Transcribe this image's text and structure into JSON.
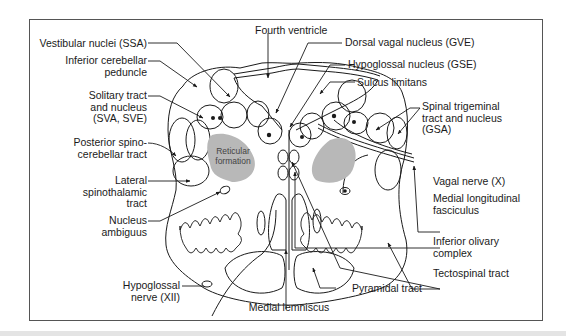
{
  "figure": {
    "colors": {
      "line": "#1a1a1a",
      "reticular_fill": "#b8b8b8",
      "frame": "#555555",
      "background": "#ffffff"
    }
  },
  "labels": {
    "top": {
      "fourth_ventricle": "Fourth ventricle"
    },
    "left": {
      "vestibular_nuclei": "Vestibular nuclei (SSA)",
      "inferior_cerebellar_peduncle": [
        "Inferior cerebellar",
        "peduncle"
      ],
      "solitary_tract": [
        "Solitary tract",
        "and nucleus",
        "(SVA, SVE)"
      ],
      "posterior_spinocerebellar": [
        "Posterior spino-",
        "cerebellar tract"
      ],
      "lateral_spinothalamic": [
        "Lateral",
        "spinothalamic",
        "tract"
      ],
      "nucleus_ambiguus": [
        "Nucleus",
        "ambiguus"
      ],
      "hypoglossal_nerve": [
        "Hypoglossal",
        "nerve (XII)"
      ]
    },
    "right": {
      "dorsal_vagal_nucleus": "Dorsal vagal nucleus (GVE)",
      "hypoglossal_nucleus": "Hypoglossal nucleus (GSE)",
      "sulcus_limitans": "Sulcus limitans",
      "spinal_trigeminal": [
        "Spinal trigeminal",
        "tract and nucleus",
        "(GSA)"
      ],
      "vagal_nerve": "Vagal nerve (X)",
      "medial_longitudinal_fasciculus": [
        "Medial longitudinal",
        "fasciculus"
      ],
      "inferior_olivary_complex": [
        "Inferior olivary",
        "complex"
      ],
      "tectospinal_tract": "Tectospinal tract",
      "pyramidal_tract": "Pyramidal tract"
    },
    "bottom": {
      "medial_lemniscus": "Medial lemniscus"
    },
    "inner": {
      "reticular_formation": [
        "Reticular",
        "formation"
      ]
    }
  }
}
